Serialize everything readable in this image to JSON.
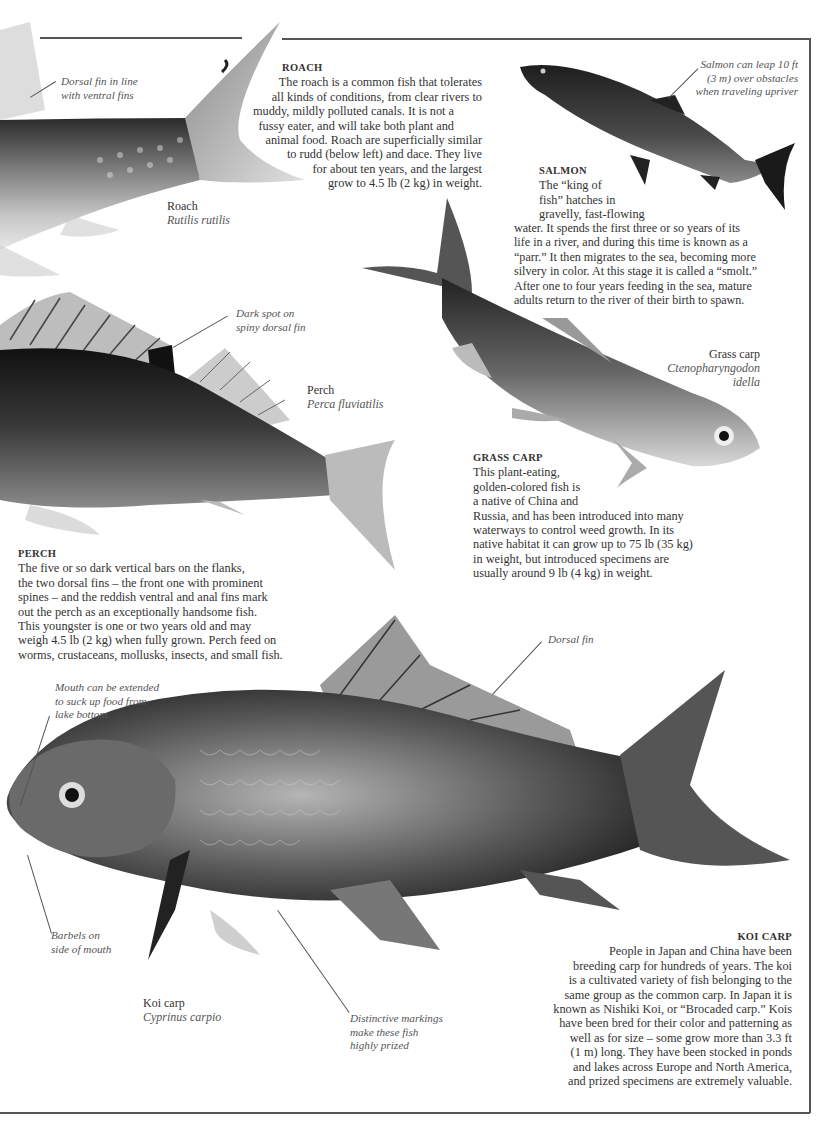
{
  "roach": {
    "heading": "ROACH",
    "lines": [
      "The roach is a common fish that tolerates",
      "all kinds of conditions, from clear rivers to",
      "muddy, mildly polluted canals. It is not a",
      "fussy eater, and will take both plant and",
      "animal food. Roach are superficially similar",
      "to rudd (below left) and dace. They live",
      "for about ten years, and the largest",
      "grow to 4.5 lb (2 kg) in weight."
    ],
    "common_name": "Roach",
    "latin_name": "Rutilis rutilis",
    "annotation": [
      "Dorsal fin in line",
      "with ventral fins"
    ]
  },
  "salmon": {
    "heading": "SALMON",
    "lines": [
      "The “king of",
      "fish” hatches in",
      "gravelly, fast-flowing",
      "water. It spends the first three or so years of its",
      "life in a river, and during this time is known as a",
      "“parr.” It then migrates to the sea, becoming more",
      "silvery in color. At this stage it is called a “smolt.”",
      "After one to four years feeding in the sea, mature",
      "adults return to the river of their birth to spawn."
    ],
    "annotation": [
      "Salmon can leap 10 ft",
      "(3 m) over obstacles",
      "when traveling upriver"
    ]
  },
  "perch": {
    "heading": "PERCH",
    "lines": [
      "The five or so dark vertical bars on the flanks,",
      "the two dorsal fins – the front one with prominent",
      "spines – and the reddish ventral and anal fins mark",
      "out the perch as an exceptionally handsome fish.",
      "This youngster is one or two years old and may",
      "weigh 4.5 lb (2 kg) when fully grown. Perch feed on",
      "worms, crustaceans, mollusks, insects, and small fish."
    ],
    "common_name": "Perch",
    "latin_name": "Perca fluviatilis",
    "annotation": [
      "Dark spot on",
      "spiny dorsal fin"
    ]
  },
  "grass_carp": {
    "heading": "GRASS CARP",
    "lines": [
      "This plant-eating,",
      "golden-colored fish is",
      "a native of China and",
      "Russia, and has been introduced into many",
      "waterways to control weed growth. In its",
      "native habitat it can grow up to 75 lb (35 kg)",
      "in weight, but introduced specimens are",
      "usually around 9 lb (4 kg) in weight."
    ],
    "common_name": "Grass carp",
    "latin_name": [
      "Ctenopharyngodon",
      "idella"
    ]
  },
  "koi_carp": {
    "heading": "KOI CARP",
    "lines": [
      "People in Japan and China have been",
      "breeding carp for hundreds of years. The koi",
      "is a cultivated variety of fish belonging to the",
      "same group as the common carp. In Japan it is",
      "known as Nishiki Koi, or “Brocaded carp.” Kois",
      "have been bred for their color and patterning as",
      "well as for size – some grow more than 3.3 ft",
      "(1 m) long. They have been stocked in ponds",
      "and lakes across Europe and North America,",
      "and prized specimens are extremely valuable."
    ],
    "common_name": "Koi carp",
    "latin_name": "Cyprinus carpio",
    "annotations": {
      "mouth": [
        "Mouth can be extended",
        "to suck up food from",
        "lake bottom"
      ],
      "dorsal": [
        "Dorsal fin"
      ],
      "barbels": [
        "Barbels on",
        "side of mouth"
      ],
      "markings": [
        "Distinctive markings",
        "make these fish",
        "highly prized"
      ]
    }
  },
  "colors": {
    "frame": "#555555",
    "text": "#333333",
    "annotation": "#555555"
  }
}
